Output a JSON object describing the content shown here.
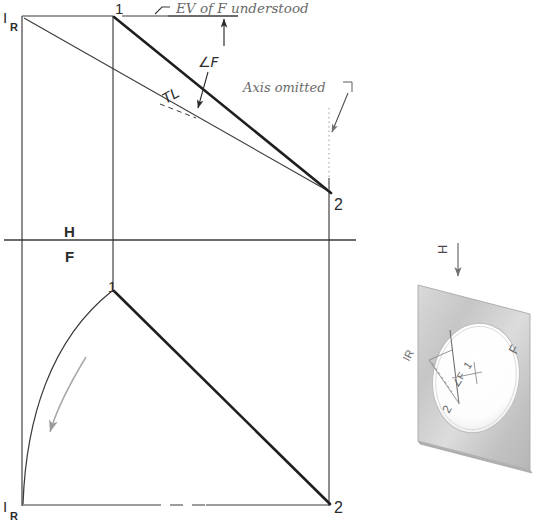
{
  "figure": {
    "ink_color": "#2b2b2b",
    "light_ink_color": "#8d8d8d",
    "paper_color": "#ffffff",
    "plate_color": "#cfcfcf"
  },
  "annotations": {
    "ev_note": "EV of F understood",
    "axis_note": "Axis omitted",
    "angle_f": "∠F",
    "true_length": "TL",
    "fold_h": "H",
    "fold_f": "F"
  },
  "labels": {
    "top_left_point": "I",
    "top_left_sub": "R",
    "top_mid_point": "1",
    "top_right_point": "2",
    "bottom_left_point": "I",
    "bottom_left_sub": "R",
    "bottom_mid_point": "1",
    "bottom_right_point": "2"
  },
  "pictorial": {
    "h_label": "H",
    "f_label": "F",
    "ir_label": "IR",
    "one_label": "1",
    "two_label": "2",
    "angle_f_label": "∠F",
    "plate_caption": ""
  },
  "geometry": {
    "top_view": {
      "left_x": 22,
      "mid_x": 113,
      "right_x": 328,
      "top_y": 16,
      "fold_y": 240,
      "point_IR": [
        22,
        16
      ],
      "point_1": [
        113,
        16
      ],
      "point_2": [
        330,
        193
      ],
      "thin_line_from_IR_to_2": true,
      "thick_line_from_1_to_2": true
    },
    "front_view": {
      "left_x": 22,
      "mid_x": 113,
      "right_x": 328,
      "bottom_y": 505,
      "point_IR": [
        22,
        505
      ],
      "point_1": [
        113,
        290
      ],
      "point_2": [
        330,
        505
      ],
      "arc_from_IR_to_1": true,
      "rotation_arrow": "counterclockwise-down"
    },
    "fold_line_y": 240,
    "fold_line_x_end": 356
  }
}
